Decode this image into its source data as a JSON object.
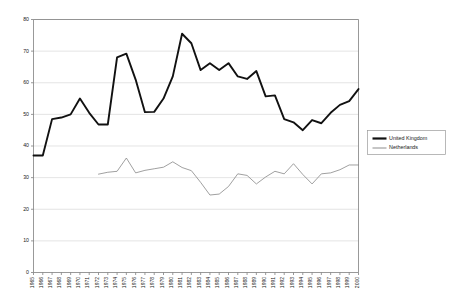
{
  "chart_data": {
    "type": "line",
    "title": "",
    "subtitle": "",
    "xlabel": "",
    "ylabel": "",
    "xlim": [
      1965,
      2000
    ],
    "ylim": [
      0,
      80
    ],
    "grid": true,
    "legend_position": "right",
    "categories": [
      "1965",
      "1966",
      "1967",
      "1968",
      "1969",
      "1970",
      "1971",
      "1972",
      "1973",
      "1974",
      "1975",
      "1976",
      "1977",
      "1978",
      "1979",
      "1980",
      "1981",
      "1982",
      "1983",
      "1984",
      "1985",
      "1986",
      "1987",
      "1988",
      "1989",
      "1990",
      "1991",
      "1992",
      "1993",
      "1994",
      "1995",
      "1996",
      "1997",
      "1998",
      "1999",
      "2000"
    ],
    "yticks": [
      0,
      10,
      20,
      30,
      40,
      50,
      60,
      70,
      80
    ],
    "series": [
      {
        "name": "United Kingdom",
        "color": "#111111",
        "style": "thick",
        "values": [
          37.0,
          37.0,
          48.5,
          49.0,
          50.0,
          55.0,
          50.5,
          46.8,
          46.8,
          68.0,
          69.2,
          61.0,
          50.7,
          50.8,
          55.0,
          62.0,
          75.5,
          72.5,
          64.0,
          66.2,
          64.0,
          66.2,
          62.0,
          61.2,
          63.7,
          55.7,
          56.0,
          48.5,
          47.5,
          45.0,
          48.2,
          47.2,
          50.5,
          53.0,
          54.2,
          58.0
        ]
      },
      {
        "name": "Netherlands",
        "color": "#808080",
        "style": "thin",
        "values": [
          null,
          null,
          null,
          null,
          null,
          null,
          null,
          31.1,
          31.7,
          32.0,
          36.2,
          31.5,
          32.3,
          32.8,
          33.3,
          35.0,
          33.2,
          32.2,
          28.5,
          24.5,
          24.8,
          27.2,
          31.2,
          30.7,
          28.0,
          30.2,
          32.0,
          31.2,
          34.4,
          31.0,
          28.0,
          31.2,
          31.5,
          32.5,
          34.0,
          34.0
        ]
      }
    ]
  },
  "legend": {
    "entries": [
      {
        "label": "United Kingdom"
      },
      {
        "label": "Netherlands"
      }
    ]
  }
}
